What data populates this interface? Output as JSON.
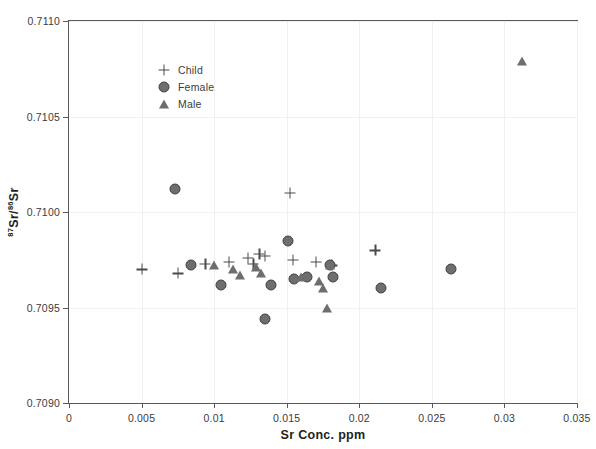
{
  "chart_data": {
    "type": "scatter",
    "title": "",
    "xlabel": "Sr Conc. ppm",
    "ylabel": "87Sr/86Sr",
    "ylabel_parts": {
      "sup1": "87",
      "mid": "Sr/",
      "sup2": "86",
      "tail": "Sr"
    },
    "xlim": [
      0,
      0.035
    ],
    "ylim": [
      0.709,
      0.711
    ],
    "xticks": [
      "0",
      "0.005",
      "0.01",
      "0.015",
      "0.02",
      "0.025",
      "0.03",
      "0.035"
    ],
    "xtick_values": [
      0,
      0.005,
      0.01,
      0.015,
      0.02,
      0.025,
      0.03,
      0.035
    ],
    "yticks": [
      "0.7090",
      "0.7095",
      "0.7100",
      "0.7105",
      "0.7110"
    ],
    "ytick_values": [
      0.709,
      0.7095,
      0.71,
      0.7105,
      0.711
    ],
    "grid": true,
    "legend_position": "top-left",
    "marker_color": "#6d6e70",
    "series": [
      {
        "name": "Child",
        "marker": "plus",
        "points": [
          [
            0.005,
            0.7097
          ],
          [
            0.0075,
            0.70968
          ],
          [
            0.0094,
            0.70973
          ],
          [
            0.011,
            0.70974
          ],
          [
            0.0123,
            0.70976
          ],
          [
            0.0127,
            0.70973
          ],
          [
            0.0131,
            0.70978
          ],
          [
            0.0135,
            0.70977
          ],
          [
            0.0152,
            0.7101
          ],
          [
            0.0154,
            0.70975
          ],
          [
            0.017,
            0.70974
          ],
          [
            0.0181,
            0.70972
          ],
          [
            0.0211,
            0.7098
          ]
        ]
      },
      {
        "name": "Female",
        "marker": "circle",
        "points": [
          [
            0.0073,
            0.71012
          ],
          [
            0.0084,
            0.70972
          ],
          [
            0.0105,
            0.70962
          ],
          [
            0.0135,
            0.70944
          ],
          [
            0.0139,
            0.70962
          ],
          [
            0.0151,
            0.70985
          ],
          [
            0.0155,
            0.70965
          ],
          [
            0.0164,
            0.70966
          ],
          [
            0.018,
            0.70972
          ],
          [
            0.0182,
            0.70966
          ],
          [
            0.0215,
            0.7096
          ],
          [
            0.0263,
            0.7097
          ]
        ]
      },
      {
        "name": "Male",
        "marker": "triangle",
        "points": [
          [
            0.01,
            0.70972
          ],
          [
            0.0113,
            0.7097
          ],
          [
            0.0118,
            0.70967
          ],
          [
            0.0129,
            0.70971
          ],
          [
            0.0132,
            0.70968
          ],
          [
            0.016,
            0.70966
          ],
          [
            0.0172,
            0.70964
          ],
          [
            0.0175,
            0.7096
          ],
          [
            0.018,
            0.70972
          ],
          [
            0.0178,
            0.7095
          ],
          [
            0.0312,
            0.71079
          ]
        ]
      }
    ]
  },
  "legend": {
    "items": [
      {
        "label": "Child",
        "marker": "plus"
      },
      {
        "label": "Female",
        "marker": "circle"
      },
      {
        "label": "Male",
        "marker": "triangle"
      }
    ]
  }
}
